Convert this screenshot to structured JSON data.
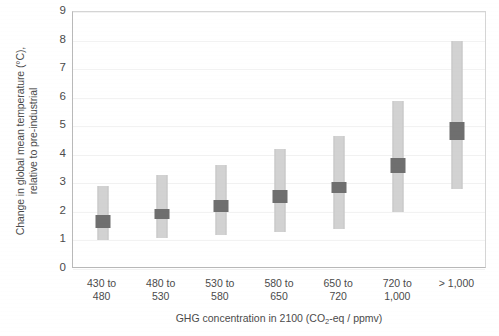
{
  "chart_data": {
    "type": "bar",
    "title": "",
    "subtitle": "",
    "xlabel_line1": "GHG concentration in 2100 (CO",
    "xlabel_sub": "2",
    "xlabel_line2": "-eq / ppmv)",
    "xlabel": "GHG concentration in 2100 (CO2-eq / ppmv)",
    "ylabel_line1": "Change in global mean temperature (°C),",
    "ylabel_line2": "relative to pre-industrial",
    "ylabel": "Change in global mean temperature (°C), relative to pre-industrial",
    "ylim": [
      0,
      9
    ],
    "yticks": [
      0,
      1,
      2,
      3,
      4,
      5,
      6,
      7,
      8,
      9
    ],
    "ytick_labels": [
      "0",
      "1",
      "2",
      "3",
      "4",
      "5",
      "6",
      "7",
      "8",
      "9"
    ],
    "grid": true,
    "legend": "none",
    "categories": [
      "430 to 480",
      "480 to 530",
      "530 to 580",
      "580 to 650",
      "650 to 720",
      "720 to 1,000",
      "> 1,000"
    ],
    "category_labels": [
      {
        "line1": "430 to",
        "line2": "480"
      },
      {
        "line1": "480 to",
        "line2": "530"
      },
      {
        "line1": "530 to",
        "line2": "580"
      },
      {
        "line1": "580 to",
        "line2": "650"
      },
      {
        "line1": "650 to",
        "line2": "720"
      },
      {
        "line1": "720 to",
        "line2": "1,000"
      },
      {
        "line1": "> 1,000",
        "line2": ""
      }
    ],
    "series": [
      {
        "name": "range",
        "kind": "range-bar",
        "low": [
          1.0,
          1.1,
          1.2,
          1.3,
          1.4,
          2.0,
          2.8
        ],
        "high": [
          2.9,
          3.3,
          3.65,
          4.2,
          4.65,
          5.9,
          8.0
        ]
      },
      {
        "name": "median",
        "kind": "median-block",
        "low": [
          1.45,
          1.75,
          2.0,
          2.3,
          2.65,
          3.35,
          4.5
        ],
        "high": [
          1.9,
          2.1,
          2.4,
          2.75,
          3.05,
          3.9,
          5.15
        ],
        "value": [
          1.65,
          1.9,
          2.2,
          2.5,
          2.85,
          3.6,
          4.8
        ]
      }
    ],
    "colors": {
      "range_fill": "#d2d2d2",
      "median_fill": "#6f6f6f",
      "axis": "#b9b9b9",
      "text": "#4b4b4b",
      "background": "#ffffff"
    }
  }
}
